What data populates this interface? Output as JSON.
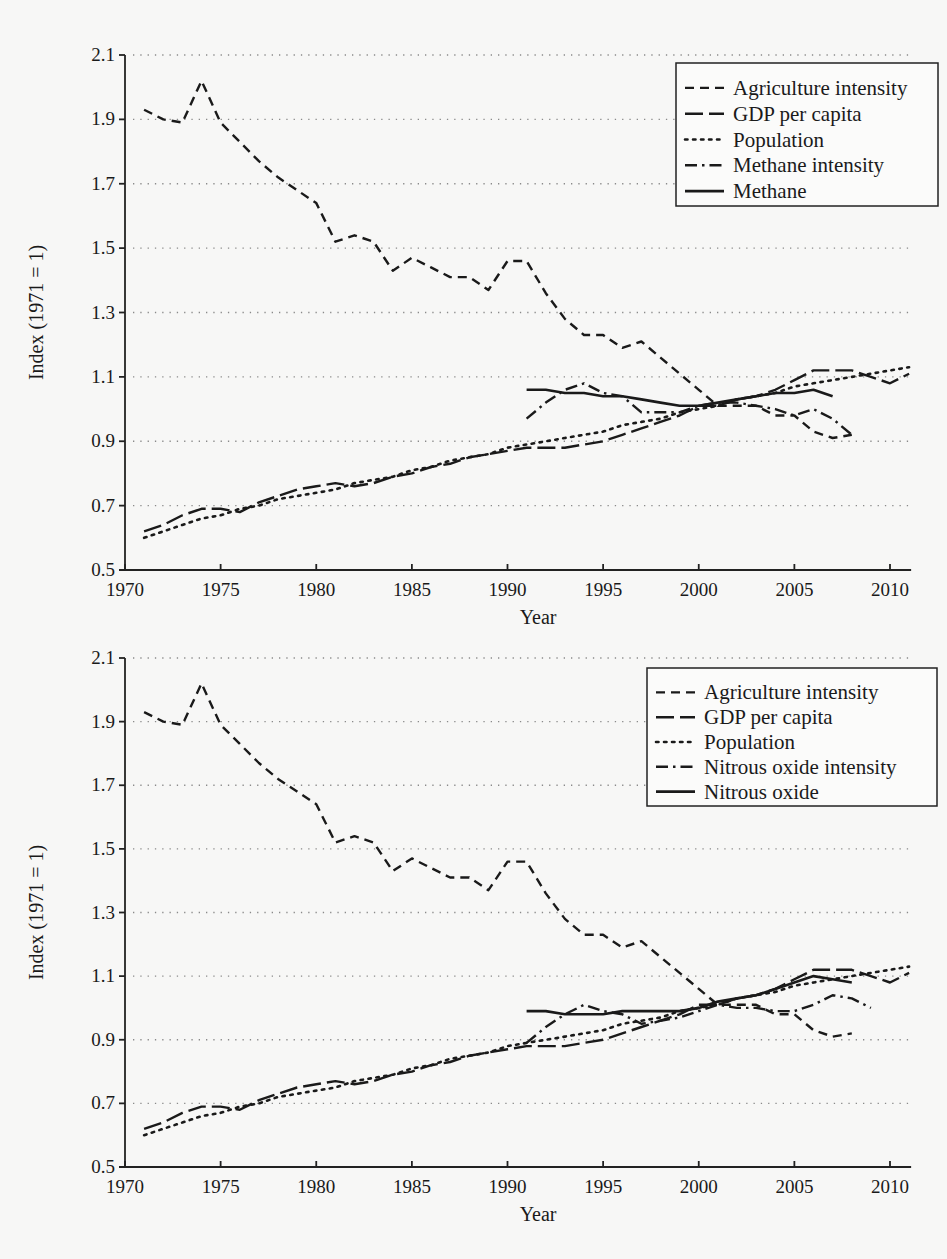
{
  "chart_data": [
    {
      "type": "line",
      "title": "",
      "xlabel": "Year",
      "ylabel": "Index (1971 = 1)",
      "xlim": [
        1970,
        2011
      ],
      "ylim": [
        0.5,
        2.1
      ],
      "x_ticks": [
        "1970",
        "1975",
        "1980",
        "1985",
        "1990",
        "1995",
        "2000",
        "2005",
        "2010"
      ],
      "y_ticks": [
        "2.1",
        "1.9",
        "1.7",
        "1.5",
        "1.3",
        "1.1",
        "0.9",
        "0.7",
        "0.5"
      ],
      "grid": "horizontal dotted",
      "legend_position": "upper right",
      "series": [
        {
          "name": "Agriculture intensity",
          "style": "dashed",
          "start_year": 1971,
          "values": [
            1.93,
            1.9,
            1.89,
            2.02,
            1.89,
            1.83,
            1.77,
            1.72,
            1.68,
            1.64,
            1.52,
            1.54,
            1.52,
            1.43,
            1.47,
            1.44,
            1.41,
            1.41,
            1.37,
            1.46,
            1.46,
            1.36,
            1.28,
            1.23,
            1.23,
            1.19,
            1.21,
            1.16,
            1.11,
            1.06,
            1.01,
            1.01,
            1.01,
            0.98,
            0.98,
            0.93,
            0.91,
            0.92
          ]
        },
        {
          "name": "GDP per capita",
          "style": "long-dashed",
          "start_year": 1971,
          "values": [
            0.62,
            0.64,
            0.67,
            0.69,
            0.69,
            0.68,
            0.71,
            0.73,
            0.75,
            0.76,
            0.77,
            0.76,
            0.77,
            0.79,
            0.8,
            0.82,
            0.83,
            0.85,
            0.86,
            0.87,
            0.88,
            0.88,
            0.88,
            0.89,
            0.9,
            0.92,
            0.94,
            0.96,
            0.98,
            1.01,
            1.01,
            1.03,
            1.04,
            1.06,
            1.09,
            1.12,
            1.12,
            1.12,
            1.1,
            1.08,
            1.11
          ]
        },
        {
          "name": "Population",
          "style": "dotted",
          "start_year": 1971,
          "values": [
            0.6,
            0.62,
            0.64,
            0.66,
            0.67,
            0.69,
            0.7,
            0.72,
            0.73,
            0.74,
            0.75,
            0.77,
            0.78,
            0.79,
            0.81,
            0.82,
            0.84,
            0.85,
            0.86,
            0.88,
            0.89,
            0.9,
            0.91,
            0.92,
            0.93,
            0.95,
            0.96,
            0.97,
            0.99,
            1.0,
            1.01,
            1.03,
            1.04,
            1.05,
            1.07,
            1.08,
            1.09,
            1.1,
            1.11,
            1.12,
            1.13
          ]
        },
        {
          "name": "Methane intensity",
          "style": "dash-dot",
          "start_year": 1991,
          "values": [
            0.97,
            1.02,
            1.06,
            1.08,
            1.05,
            1.04,
            0.99,
            0.99,
            0.99,
            1.01,
            1.02,
            1.02,
            1.01,
            1.0,
            0.98,
            1.0,
            0.97,
            0.92
          ]
        },
        {
          "name": "Methane",
          "style": "solid (drawn with long-dash appearance)",
          "start_year": 1991,
          "values": [
            1.06,
            1.06,
            1.05,
            1.05,
            1.04,
            1.04,
            1.03,
            1.02,
            1.01,
            1.01,
            1.02,
            1.03,
            1.04,
            1.05,
            1.05,
            1.06,
            1.04
          ]
        }
      ]
    },
    {
      "type": "line",
      "title": "",
      "xlabel": "Year",
      "ylabel": "Index (1971 = 1)",
      "xlim": [
        1970,
        2011
      ],
      "ylim": [
        0.5,
        2.1
      ],
      "x_ticks": [
        "1970",
        "1975",
        "1980",
        "1985",
        "1990",
        "1995",
        "2000",
        "2005",
        "2010"
      ],
      "y_ticks": [
        "2.1",
        "1.9",
        "1.7",
        "1.5",
        "1.3",
        "1.1",
        "0.9",
        "0.7",
        "0.5"
      ],
      "grid": "horizontal dotted",
      "legend_position": "upper right",
      "series": [
        {
          "name": "Agriculture intensity",
          "style": "dashed",
          "start_year": 1971,
          "values": [
            1.93,
            1.9,
            1.89,
            2.02,
            1.89,
            1.83,
            1.77,
            1.72,
            1.68,
            1.64,
            1.52,
            1.54,
            1.52,
            1.43,
            1.47,
            1.44,
            1.41,
            1.41,
            1.37,
            1.46,
            1.46,
            1.36,
            1.28,
            1.23,
            1.23,
            1.19,
            1.21,
            1.16,
            1.11,
            1.06,
            1.01,
            1.01,
            1.01,
            0.98,
            0.98,
            0.93,
            0.91,
            0.92
          ]
        },
        {
          "name": "GDP per capita",
          "style": "long-dashed",
          "start_year": 1971,
          "values": [
            0.62,
            0.64,
            0.67,
            0.69,
            0.69,
            0.68,
            0.71,
            0.73,
            0.75,
            0.76,
            0.77,
            0.76,
            0.77,
            0.79,
            0.8,
            0.82,
            0.83,
            0.85,
            0.86,
            0.87,
            0.88,
            0.88,
            0.88,
            0.89,
            0.9,
            0.92,
            0.94,
            0.96,
            0.98,
            1.01,
            1.01,
            1.03,
            1.04,
            1.06,
            1.09,
            1.12,
            1.12,
            1.12,
            1.1,
            1.08,
            1.11
          ]
        },
        {
          "name": "Population",
          "style": "dotted",
          "start_year": 1971,
          "values": [
            0.6,
            0.62,
            0.64,
            0.66,
            0.67,
            0.69,
            0.7,
            0.72,
            0.73,
            0.74,
            0.75,
            0.77,
            0.78,
            0.79,
            0.81,
            0.82,
            0.84,
            0.85,
            0.86,
            0.88,
            0.89,
            0.9,
            0.91,
            0.92,
            0.93,
            0.95,
            0.96,
            0.97,
            0.99,
            1.0,
            1.01,
            1.03,
            1.04,
            1.05,
            1.07,
            1.08,
            1.09,
            1.1,
            1.11,
            1.12,
            1.13
          ]
        },
        {
          "name": "Nitrous oxide intensity",
          "style": "dash-dot",
          "start_year": 1991,
          "values": [
            0.89,
            0.94,
            0.98,
            1.01,
            0.99,
            0.98,
            0.95,
            0.96,
            0.97,
            0.99,
            1.01,
            1.0,
            1.0,
            0.99,
            0.99,
            1.01,
            1.04,
            1.03,
            1.0
          ]
        },
        {
          "name": "Nitrous oxide",
          "style": "solid",
          "start_year": 1991,
          "values": [
            0.99,
            0.99,
            0.98,
            0.98,
            0.98,
            0.99,
            0.99,
            0.99,
            0.99,
            1.0,
            1.02,
            1.03,
            1.04,
            1.06,
            1.08,
            1.1,
            1.09,
            1.08
          ]
        }
      ]
    }
  ],
  "charts": [
    {
      "ylabel": "Index (1971 = 1)",
      "xlabel": "Year",
      "legend": [
        "Agriculture intensity",
        "GDP per capita",
        "Population",
        "Methane intensity",
        "Methane"
      ]
    },
    {
      "ylabel": "Index (1971 = 1)",
      "xlabel": "Year",
      "legend": [
        "Agriculture intensity",
        "GDP per capita",
        "Population",
        "Nitrous oxide intensity",
        "Nitrous oxide"
      ]
    }
  ],
  "layout": {
    "x_px_1970": 125,
    "x_px_per_year": 19.125,
    "top": {
      "y_px_at_2_1": 55,
      "y_px_at_0_5": 570,
      "legend": {
        "x": 676,
        "y": 63,
        "w": 262,
        "h": 143
      }
    },
    "bottom": {
      "y_px_at_2_1": 58,
      "y_px_at_0_5": 567,
      "legend": {
        "x": 647,
        "y": 68,
        "w": 290,
        "h": 138
      }
    }
  }
}
